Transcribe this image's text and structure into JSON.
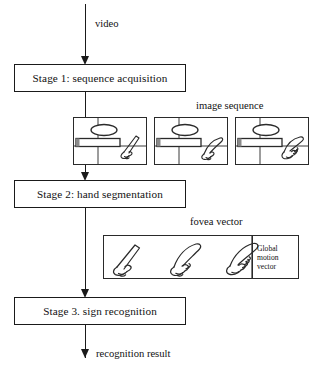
{
  "diagram": {
    "title_visible": false,
    "stages": [
      {
        "id": "stage1",
        "label": "Stage 1: sequence acquisition"
      },
      {
        "id": "stage2",
        "label": "Stage 2: hand segmentation"
      },
      {
        "id": "stage3",
        "label": "Stage 3. sign recognition"
      }
    ],
    "flow_labels": {
      "input": "video",
      "output": "recognition result"
    },
    "annotations": {
      "image_sequence": "image sequence",
      "fovea_vector": "fovea vector"
    },
    "global_motion_vector": {
      "line1": "Global",
      "line2": "motion",
      "line3": "vector"
    },
    "image_sequence_frames": [
      {
        "name": "frame-1"
      },
      {
        "name": "frame-2"
      },
      {
        "name": "frame-3"
      }
    ],
    "fovea_hands": [
      {
        "name": "fovea-hand-1"
      },
      {
        "name": "fovea-hand-2"
      },
      {
        "name": "fovea-hand-3"
      }
    ],
    "colors": {
      "stroke": "#1a1a1a",
      "frame_stroke": "#2a2a2a",
      "background": "#ffffff",
      "text": "#111111"
    }
  }
}
